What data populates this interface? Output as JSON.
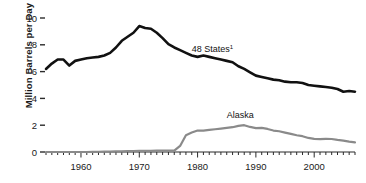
{
  "chart_data": {
    "type": "line",
    "title": "",
    "xlabel": "",
    "ylabel": "Million Barrels per Day",
    "xlim": [
      1954,
      2007
    ],
    "ylim": [
      0,
      10
    ],
    "grid": false,
    "legend": "inline-annotations",
    "yticks": [
      0,
      2,
      4,
      6,
      8,
      10
    ],
    "ytick_labels": [
      "0",
      "2",
      "4",
      "6",
      "8",
      "10"
    ],
    "xticks": [
      1960,
      1970,
      1980,
      1990,
      2000
    ],
    "xtick_labels": [
      "1960",
      "1970",
      "1980",
      "1990",
      "2000"
    ],
    "xtick_minor_interval": 1,
    "annotations": [
      {
        "text": "48 States",
        "superscript": "1",
        "x": 1979,
        "y": 7.45
      },
      {
        "text": "Alaska",
        "x": 1985,
        "y": 2.55
      }
    ],
    "series": [
      {
        "name": "48 States",
        "label": "48 States¹",
        "color": "#111111",
        "x": [
          1954,
          1955,
          1956,
          1957,
          1958,
          1959,
          1960,
          1961,
          1962,
          1963,
          1964,
          1965,
          1966,
          1967,
          1968,
          1969,
          1970,
          1971,
          1972,
          1973,
          1974,
          1975,
          1976,
          1977,
          1978,
          1979,
          1980,
          1981,
          1982,
          1983,
          1984,
          1985,
          1986,
          1987,
          1988,
          1989,
          1990,
          1991,
          1992,
          1993,
          1994,
          1995,
          1996,
          1997,
          1998,
          1999,
          2000,
          2001,
          2002,
          2003,
          2004,
          2005,
          2006,
          2007
        ],
        "values": [
          6.2,
          6.6,
          6.9,
          6.9,
          6.45,
          6.8,
          6.9,
          7.0,
          7.05,
          7.1,
          7.2,
          7.4,
          7.8,
          8.3,
          8.6,
          8.9,
          9.4,
          9.25,
          9.2,
          8.9,
          8.5,
          8.05,
          7.8,
          7.6,
          7.4,
          7.2,
          7.1,
          7.2,
          7.1,
          7.0,
          6.9,
          6.8,
          6.7,
          6.4,
          6.2,
          5.95,
          5.7,
          5.6,
          5.5,
          5.4,
          5.35,
          5.25,
          5.2,
          5.2,
          5.15,
          5.0,
          4.95,
          4.9,
          4.85,
          4.8,
          4.7,
          4.5,
          4.55,
          4.5
        ]
      },
      {
        "name": "Alaska",
        "label": "Alaska",
        "color": "#8a8a8a",
        "x": [
          1954,
          1955,
          1956,
          1957,
          1958,
          1959,
          1960,
          1961,
          1962,
          1963,
          1964,
          1965,
          1966,
          1967,
          1968,
          1969,
          1970,
          1971,
          1972,
          1973,
          1974,
          1975,
          1976,
          1977,
          1978,
          1979,
          1980,
          1981,
          1982,
          1983,
          1984,
          1985,
          1986,
          1987,
          1988,
          1989,
          1990,
          1991,
          1992,
          1993,
          1994,
          1995,
          1996,
          1997,
          1998,
          1999,
          2000,
          2001,
          2002,
          2003,
          2004,
          2005,
          2006,
          2007
        ],
        "values": [
          0.0,
          0.0,
          0.0,
          0.0,
          0.0,
          0.0,
          0.0,
          0.0,
          0.01,
          0.02,
          0.03,
          0.03,
          0.04,
          0.05,
          0.06,
          0.07,
          0.08,
          0.08,
          0.09,
          0.1,
          0.1,
          0.1,
          0.1,
          0.45,
          1.25,
          1.45,
          1.6,
          1.6,
          1.65,
          1.7,
          1.75,
          1.8,
          1.85,
          1.95,
          2.0,
          1.87,
          1.78,
          1.8,
          1.72,
          1.6,
          1.55,
          1.45,
          1.35,
          1.25,
          1.18,
          1.05,
          0.98,
          0.96,
          0.98,
          0.97,
          0.9,
          0.85,
          0.78,
          0.72
        ]
      }
    ]
  }
}
